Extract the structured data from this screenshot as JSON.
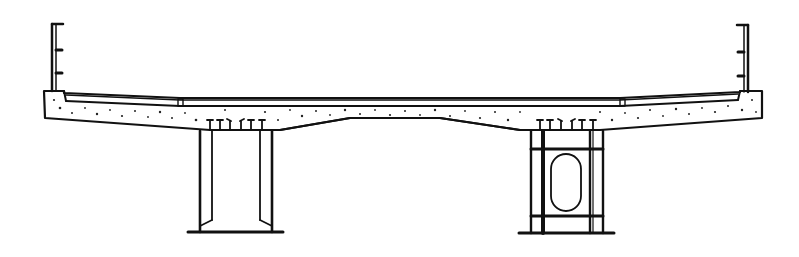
{
  "diagram": {
    "type": "bridge-deck-cross-section",
    "colors": {
      "ink": "#111111",
      "background": "#ffffff"
    },
    "elements": {
      "deck_slab": "concrete-deck-slab",
      "wearing_surface": "deck-wearing-surface",
      "parapets": [
        "left-parapet",
        "right-parapet"
      ],
      "railings": [
        "left-railing",
        "right-railing"
      ],
      "girders": [
        {
          "name": "left-girder",
          "type": "open-steel-girder"
        },
        {
          "name": "right-girder",
          "type": "box-steel-girder-with-opening"
        }
      ],
      "shear_connectors": [
        "left-shear-connectors",
        "right-shear-connectors"
      ]
    }
  }
}
